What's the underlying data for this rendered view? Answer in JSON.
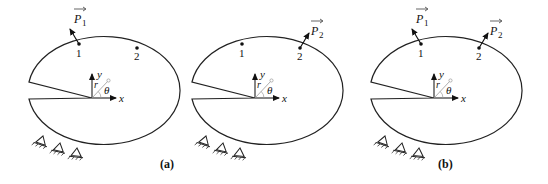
{
  "figure": {
    "panels": [
      {
        "id": "a1",
        "offset_x": 0,
        "points": [
          {
            "label": "1"
          },
          {
            "label": "2"
          }
        ],
        "loads": [
          {
            "label": "P",
            "sub": "1",
            "at": "1"
          }
        ],
        "caption": ""
      },
      {
        "id": "a2",
        "offset_x": 163,
        "points": [
          {
            "label": "1"
          },
          {
            "label": "2"
          }
        ],
        "loads": [
          {
            "label": "P",
            "sub": "2",
            "at": "2"
          }
        ],
        "caption": "(a)"
      },
      {
        "id": "b",
        "offset_x": 342,
        "points": [
          {
            "label": "1"
          },
          {
            "label": "2"
          }
        ],
        "loads": [
          {
            "label": "P",
            "sub": "1",
            "at": "1"
          },
          {
            "label": "P",
            "sub": "2",
            "at": "2"
          }
        ],
        "caption": "(b)"
      }
    ],
    "axes": {
      "x_label": "x",
      "y_label": "y",
      "r_label": "r",
      "theta_label": "θ"
    },
    "captions": {
      "a": "(a)",
      "b": "(b)"
    },
    "colors": {
      "stroke": "#222222",
      "guide": "#9a9a9a",
      "background": "#ffffff"
    }
  }
}
